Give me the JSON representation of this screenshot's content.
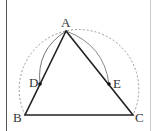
{
  "diagram": {
    "points": {
      "A": {
        "label": "A",
        "x": 66,
        "y": 31
      },
      "B": {
        "label": "B",
        "x": 25,
        "y": 115
      },
      "C": {
        "label": "C",
        "x": 133,
        "y": 115
      },
      "D": {
        "label": "D",
        "x": 40,
        "y": 84
      },
      "E": {
        "label": "E",
        "x": 109,
        "y": 84
      }
    },
    "segments": [
      [
        "A",
        "B"
      ],
      [
        "B",
        "C"
      ],
      [
        "C",
        "A"
      ]
    ],
    "dashed_arc": "circle through B, A, C",
    "solid_arcs": [
      "A to D",
      "A to E"
    ],
    "colors": {
      "stroke": "#222222",
      "arc": "#888888",
      "dashed": "#999999"
    }
  }
}
